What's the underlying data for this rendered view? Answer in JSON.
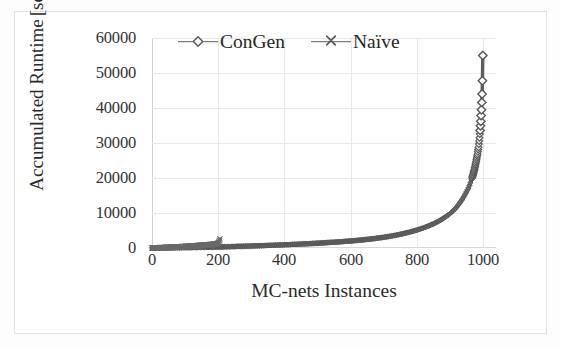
{
  "figure": {
    "kind": "scanned-line-chart",
    "background_color": "#ffffff",
    "frame_color": "#e3e3e3",
    "ink_color": "#5d5d5d",
    "text_color": "#2b2b2b",
    "gridline_color": "#e9e9e9"
  },
  "chart_data": {
    "type": "line",
    "title": "",
    "xlabel": "MC-nets Instances",
    "ylabel": "Accumulated Runtime [sec]",
    "ylabel_lines": [
      "Accumulated Runtime",
      "[sec]"
    ],
    "xlim": [
      0,
      1040
    ],
    "ylim": [
      0,
      60000
    ],
    "xticks": [
      0,
      200,
      400,
      600,
      800,
      1000
    ],
    "xtick_labels": [
      "0",
      "200",
      "400",
      "600",
      "800",
      "1000"
    ],
    "yticks": [
      0,
      10000,
      20000,
      30000,
      40000,
      50000,
      60000
    ],
    "ytick_labels": [
      "0",
      "10000",
      "20000",
      "30000",
      "40000",
      "50000",
      "60000"
    ],
    "grid": true,
    "grid_axes": "both",
    "legend_position": "top-inside-left",
    "series": [
      {
        "name": "ConGen",
        "marker": "diamond",
        "color": "#5d5d5d",
        "x": [
          0,
          25,
          50,
          75,
          100,
          125,
          150,
          175,
          200,
          225,
          250,
          275,
          300,
          325,
          350,
          375,
          400,
          425,
          450,
          475,
          500,
          525,
          550,
          575,
          600,
          625,
          650,
          675,
          700,
          720,
          740,
          760,
          780,
          800,
          820,
          840,
          860,
          875,
          890,
          900,
          910,
          920,
          930,
          940,
          950,
          958,
          965,
          970,
          975,
          980,
          984,
          987,
          990,
          992,
          994,
          996,
          997,
          998,
          999,
          1000
        ],
        "y": [
          0,
          20,
          45,
          75,
          110,
          150,
          195,
          245,
          300,
          360,
          425,
          495,
          570,
          650,
          735,
          825,
          920,
          1020,
          1125,
          1240,
          1365,
          1500,
          1650,
          1815,
          2000,
          2210,
          2450,
          2730,
          3050,
          3360,
          3710,
          4110,
          4570,
          5100,
          5720,
          6450,
          7320,
          8100,
          9050,
          9750,
          10600,
          11600,
          12800,
          14200,
          15900,
          17400,
          19200,
          20700,
          22500,
          24700,
          26800,
          28800,
          31500,
          33600,
          36200,
          39500,
          41600,
          44000,
          47800,
          55000
        ]
      },
      {
        "name": "Naïve",
        "marker": "x",
        "color": "#5d5d5d",
        "x": [
          0,
          20,
          40,
          60,
          80,
          100,
          120,
          140,
          155,
          170,
          180,
          190,
          196,
          200,
          203,
          205
        ],
        "y": [
          0,
          60,
          130,
          215,
          310,
          420,
          545,
          690,
          790,
          910,
          1000,
          1110,
          1200,
          1320,
          1700,
          2600
        ]
      }
    ]
  },
  "legend": {
    "entries": [
      {
        "label": "ConGen",
        "marker": "diamond-marker",
        "color": "#5d5d5d"
      },
      {
        "label": "Naïve",
        "marker": "x-marker",
        "color": "#5d5d5d"
      }
    ]
  },
  "axes": {
    "y_title_line1": "Accumulated Runtime",
    "y_title_line2": "[sec]",
    "x_title": "MC-nets Instances",
    "y_tick_labels": [
      "60000",
      "50000",
      "40000",
      "30000",
      "20000",
      "10000",
      "0"
    ],
    "x_tick_labels": [
      "0",
      "200",
      "400",
      "600",
      "800",
      "1000"
    ]
  }
}
